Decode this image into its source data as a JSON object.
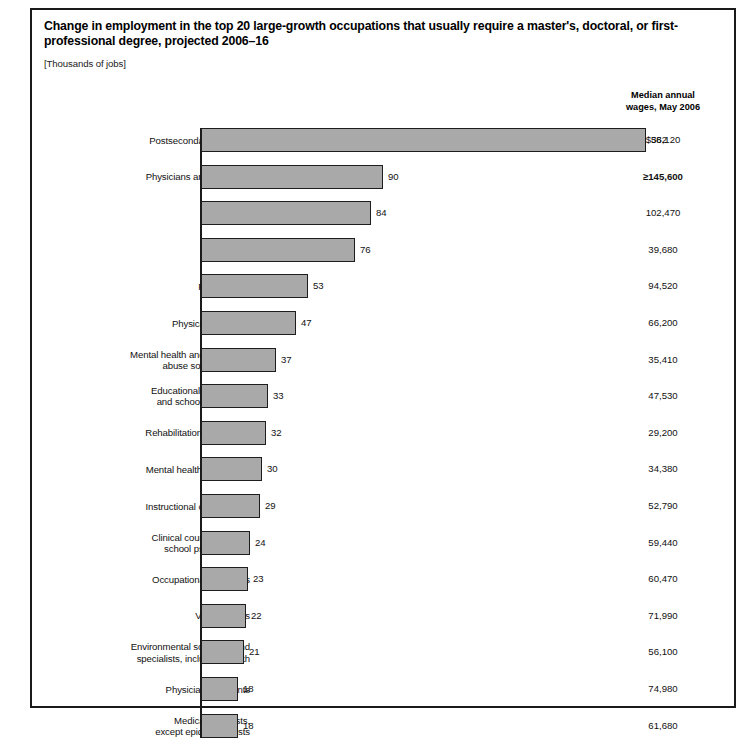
{
  "chart": {
    "title": "Change in employment in the top 20 large-growth occupations that usually require a master's, doctoral, or first-professional degree, projected 2006–16",
    "units_note": "[Thousands of jobs]",
    "wages_header_line1": "Median annual",
    "wages_header_line2": "wages, May 2006",
    "bar_fill_color": "#a9a9a9",
    "bar_border_color": "#1d1d1d",
    "axis_color": "#1a1a1a",
    "frame_color": "#1a1a1a"
  },
  "chart_data": {
    "type": "bar",
    "orientation": "horizontal",
    "title": "Change in employment in the top 20 large-growth occupations that usually require a master's, doctoral, or first-professional degree, projected 2006–16",
    "xlabel": "",
    "ylabel": "",
    "units": "Thousands of jobs",
    "grid": false,
    "legend": false,
    "value_labels": true,
    "note": "Top bar (382) is drawn on a truncated axis; remaining bars use a linear scale of about 2.02 px per thousand jobs.",
    "categories": [
      "Postsecondary teachers",
      "Physicians and surgeons",
      "Lawyers",
      "Clergy",
      "Pharmacists",
      "Physical therapists",
      "Mental health and substance abuse social workers",
      "Educational, vocational, and school counselors",
      "Rehabilitation counselors",
      "Mental health counselors",
      "Instructional coordinators",
      "Clinical counseling, and school psychologists",
      "Occupational therapists",
      "Veterinarians",
      "Environmental scientists and specialists, including health",
      "Physician assistants",
      "Medical scientists, except epidemiologists"
    ],
    "values": [
      382,
      90,
      84,
      76,
      53,
      47,
      37,
      33,
      32,
      30,
      29,
      24,
      23,
      22,
      21,
      18,
      18
    ],
    "median_annual_wages_may_2006": [
      "$56,120",
      "≥145,600",
      "102,470",
      "39,680",
      "94,520",
      "66,200",
      "35,410",
      "47,530",
      "29,200",
      "34,380",
      "52,790",
      "59,440",
      "60,470",
      "71,990",
      "56,100",
      "74,980",
      "61,680"
    ]
  },
  "rows": [
    {
      "label_lines": [
        "Postsecondary teachers"
      ],
      "value": 382,
      "value_text": "382",
      "wage": "$56,120",
      "wage_emph": false,
      "bar_px": 445
    },
    {
      "label_lines": [
        "Physicians and surgeons"
      ],
      "value": 90,
      "value_text": "90",
      "wage": "≥145,600",
      "wage_emph": true,
      "bar_px": 182
    },
    {
      "label_lines": [
        "Lawyers"
      ],
      "value": 84,
      "value_text": "84",
      "wage": "102,470",
      "wage_emph": false,
      "bar_px": 170
    },
    {
      "label_lines": [
        "Clergy"
      ],
      "value": 76,
      "value_text": "76",
      "wage": "39,680",
      "wage_emph": false,
      "bar_px": 154
    },
    {
      "label_lines": [
        "Pharmacists"
      ],
      "value": 53,
      "value_text": "53",
      "wage": "94,520",
      "wage_emph": false,
      "bar_px": 107
    },
    {
      "label_lines": [
        "Physical therapists"
      ],
      "value": 47,
      "value_text": "47",
      "wage": "66,200",
      "wage_emph": false,
      "bar_px": 95
    },
    {
      "label_lines": [
        "Mental health and substance",
        "abuse social workers"
      ],
      "value": 37,
      "value_text": "37",
      "wage": "35,410",
      "wage_emph": false,
      "bar_px": 75
    },
    {
      "label_lines": [
        "Educational, vocational,",
        "and school counselors"
      ],
      "value": 33,
      "value_text": "33",
      "wage": "47,530",
      "wage_emph": false,
      "bar_px": 67
    },
    {
      "label_lines": [
        "Rehabilitation counselors"
      ],
      "value": 32,
      "value_text": "32",
      "wage": "29,200",
      "wage_emph": false,
      "bar_px": 65
    },
    {
      "label_lines": [
        "Mental health counselors"
      ],
      "value": 30,
      "value_text": "30",
      "wage": "34,380",
      "wage_emph": false,
      "bar_px": 61
    },
    {
      "label_lines": [
        "Instructional coordinators"
      ],
      "value": 29,
      "value_text": "29",
      "wage": "52,790",
      "wage_emph": false,
      "bar_px": 59
    },
    {
      "label_lines": [
        "Clinical counseling, and",
        "school psychologists"
      ],
      "value": 24,
      "value_text": "24",
      "wage": "59,440",
      "wage_emph": false,
      "bar_px": 49
    },
    {
      "label_lines": [
        "Occupational therapists"
      ],
      "value": 23,
      "value_text": "23",
      "wage": "60,470",
      "wage_emph": false,
      "bar_px": 47
    },
    {
      "label_lines": [
        "Veterinarians"
      ],
      "value": 22,
      "value_text": "22",
      "wage": "71,990",
      "wage_emph": false,
      "bar_px": 45
    },
    {
      "label_lines": [
        "Environmental scientists and",
        "specialists, including health"
      ],
      "value": 21,
      "value_text": "21",
      "wage": "56,100",
      "wage_emph": false,
      "bar_px": 43
    },
    {
      "label_lines": [
        "Physician assistants"
      ],
      "value": 18,
      "value_text": "18",
      "wage": "74,980",
      "wage_emph": false,
      "bar_px": 37
    },
    {
      "label_lines": [
        "Medical scientists,",
        "except epidemiologists"
      ],
      "value": 18,
      "value_text": "18",
      "wage": "61,680",
      "wage_emph": false,
      "bar_px": 37
    }
  ]
}
